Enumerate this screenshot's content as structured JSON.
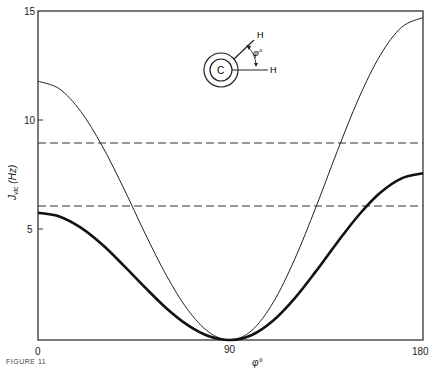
{
  "chart_data": {
    "type": "line",
    "title": "",
    "xlabel": "φ°",
    "ylabel": "J_vic (Hz)",
    "xlim": [
      0,
      180
    ],
    "ylim": [
      0,
      15
    ],
    "x_ticks": [
      "0",
      "90",
      "180"
    ],
    "y_ticks": [
      "5",
      "10",
      "15"
    ],
    "grid": false,
    "x": [
      0,
      10,
      20,
      30,
      40,
      50,
      60,
      70,
      80,
      90,
      100,
      110,
      120,
      130,
      140,
      150,
      160,
      170,
      180
    ],
    "series": [
      {
        "name": "upper curve (thin)",
        "style": "thin solid",
        "values": [
          11.8,
          11.45,
          10.42,
          8.85,
          6.93,
          4.87,
          2.95,
          1.38,
          0.35,
          0,
          0.44,
          1.72,
          3.68,
          6.07,
          8.63,
          11.03,
          12.98,
          14.26,
          14.7
        ]
      },
      {
        "name": "lower curve (thick)",
        "style": "thick solid",
        "values": [
          5.8,
          5.63,
          5.12,
          4.35,
          3.4,
          2.4,
          1.45,
          0.68,
          0.17,
          0,
          0.23,
          0.89,
          1.9,
          3.14,
          4.46,
          5.7,
          6.71,
          7.37,
          7.6
        ]
      }
    ],
    "reference_lines": [
      {
        "style": "dashed",
        "y": 9.0
      },
      {
        "style": "dashed",
        "y": 6.05
      }
    ],
    "annotations": {
      "inset_diagram": {
        "center_label": "C",
        "atom_labels": [
          "H",
          "H"
        ],
        "angle_label": "φ°"
      }
    }
  },
  "caption": "FIGURE 11"
}
